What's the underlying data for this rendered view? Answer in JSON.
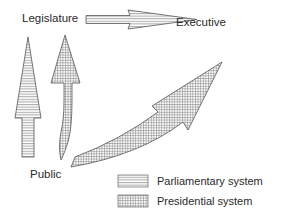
{
  "diagram": {
    "nodes": {
      "legislature": "Legislature",
      "executive": "Executive",
      "public": "Public"
    },
    "arrows": [
      {
        "from": "Legislature",
        "to": "Executive",
        "system": "Parliamentary system"
      },
      {
        "from": "Public",
        "to": "Legislature",
        "system": "Parliamentary system"
      },
      {
        "from": "Public",
        "to": "Legislature",
        "system": "Presidential system"
      },
      {
        "from": "Public",
        "to": "Executive",
        "system": "Presidential system"
      }
    ],
    "legend": [
      {
        "label": "Parliamentary system",
        "pattern": "horizontal-lines"
      },
      {
        "label": "Presidential system",
        "pattern": "grid"
      }
    ],
    "colors": {
      "stroke": "#555555",
      "text": "#2a2a2a",
      "background": "#ffffff"
    }
  }
}
